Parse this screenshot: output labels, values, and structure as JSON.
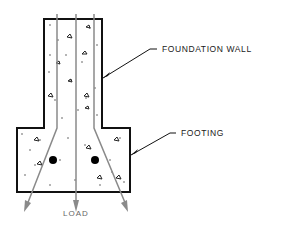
{
  "diagram": {
    "labels": {
      "foundation_wall": "FOUNDATION WALL",
      "footing": "FOOTING",
      "load": "LOAD"
    },
    "components": [
      {
        "name": "foundation-wall",
        "type": "concrete-rect"
      },
      {
        "name": "footing",
        "type": "concrete-rect"
      },
      {
        "name": "rebar-left",
        "type": "reinforcing-bar"
      },
      {
        "name": "rebar-right",
        "type": "reinforcing-bar"
      },
      {
        "name": "load-lines",
        "count": 3,
        "type": "arrows",
        "direction": "downward-spreading"
      }
    ],
    "colors": {
      "outline": "#111111",
      "load_line": "#8a8a8a",
      "label": "#1a1a1a",
      "load_label": "#666666"
    }
  }
}
